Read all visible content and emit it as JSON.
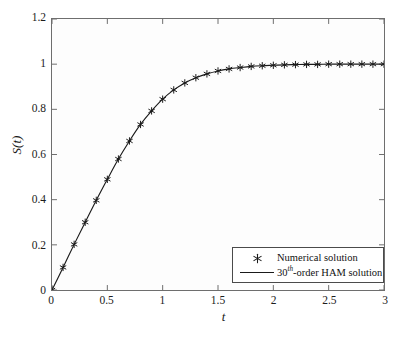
{
  "chart_data": {
    "type": "line",
    "title": "",
    "subtitle": "",
    "xlabel": "t",
    "ylabel": "S(t)",
    "xlim": [
      0,
      3
    ],
    "ylim": [
      0,
      1.2
    ],
    "xticks": [
      0,
      0.5,
      1,
      1.5,
      2,
      2.5,
      3
    ],
    "xticklabels": [
      "0",
      "0.5",
      "1",
      "1.5",
      "2",
      "2.5",
      "3"
    ],
    "yticks": [
      0,
      0.2,
      0.4,
      0.6,
      0.8,
      1,
      1.2
    ],
    "yticklabels": [
      "0",
      "0.2",
      "0.4",
      "0.6",
      "0.8",
      "1",
      "1.2"
    ],
    "grid": false,
    "tick_direction": "in",
    "legend_position": "lower right",
    "series": [
      {
        "name": "Numerical solution",
        "style": "marker",
        "marker": "asterisk",
        "color": "#1a1a1a",
        "x": [
          0,
          0.1,
          0.2,
          0.3,
          0.4,
          0.5,
          0.6,
          0.7,
          0.8,
          0.9,
          1.0,
          1.1,
          1.2,
          1.3,
          1.4,
          1.5,
          1.6,
          1.7,
          1.8,
          1.9,
          2.0,
          2.1,
          2.2,
          2.3,
          2.4,
          2.5,
          2.6,
          2.7,
          2.8,
          2.9,
          3.0
        ],
        "values": [
          0,
          0.1,
          0.202,
          0.3,
          0.397,
          0.49,
          0.58,
          0.66,
          0.733,
          0.793,
          0.845,
          0.886,
          0.917,
          0.94,
          0.957,
          0.97,
          0.979,
          0.985,
          0.99,
          0.993,
          0.995,
          0.997,
          0.998,
          0.999,
          0.999,
          1.0,
          1.0,
          1.0,
          1.0,
          1.0,
          1.0
        ]
      },
      {
        "name": "30th-order HAM solution",
        "style": "line",
        "marker": "none",
        "color": "#1a1a1a",
        "x": [
          0,
          0.1,
          0.2,
          0.3,
          0.4,
          0.5,
          0.6,
          0.7,
          0.8,
          0.9,
          1.0,
          1.1,
          1.2,
          1.3,
          1.4,
          1.5,
          1.6,
          1.7,
          1.8,
          1.9,
          2.0,
          2.1,
          2.2,
          2.3,
          2.4,
          2.5,
          2.6,
          2.7,
          2.8,
          2.9,
          3.0
        ],
        "values": [
          0,
          0.1,
          0.202,
          0.3,
          0.397,
          0.49,
          0.58,
          0.66,
          0.733,
          0.793,
          0.845,
          0.886,
          0.917,
          0.94,
          0.957,
          0.97,
          0.979,
          0.985,
          0.99,
          0.993,
          0.995,
          0.997,
          0.998,
          0.999,
          0.999,
          1.0,
          1.0,
          1.0,
          1.0,
          1.0,
          1.0
        ]
      }
    ]
  },
  "axes": {
    "xlabel": "t",
    "ylabel_S": "S",
    "ylabel_open": "(",
    "ylabel_t": "t",
    "ylabel_close": ")"
  },
  "legend": {
    "entries": [
      {
        "marker_icon": "asterisk-marker",
        "label": "Numerical solution"
      },
      {
        "marker_icon": "line-sample",
        "label_pre": "30",
        "label_sup": "th",
        "label_post": "-order HAM solution"
      }
    ]
  },
  "colors": {
    "line": "#1a1a1a",
    "marker": "#1a1a1a",
    "axis": "#6e6e6e",
    "text": "#1a1a1a",
    "background": "#ffffff",
    "plot_background": "#fdfdfd"
  }
}
